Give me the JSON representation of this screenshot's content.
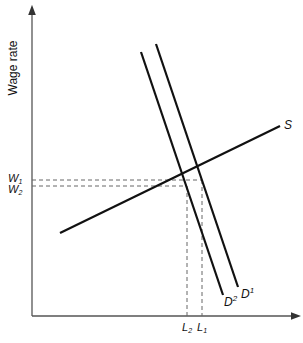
{
  "diagram": {
    "type": "labor-market supply-demand",
    "y_axis_label": "Wage rate",
    "x_axis_label": "",
    "curves": [
      {
        "id": "S",
        "label": "S",
        "kind": "supply"
      },
      {
        "id": "D1",
        "label": "D",
        "sup": "1",
        "kind": "demand"
      },
      {
        "id": "D2",
        "label": "D",
        "sup": "2",
        "kind": "demand"
      }
    ],
    "wage_ticks": [
      {
        "label": "W",
        "sub": "1"
      },
      {
        "label": "W",
        "sub": "2"
      }
    ],
    "quantity_ticks": [
      {
        "label": "L",
        "sub": "2"
      },
      {
        "label": "L",
        "sub": "1"
      }
    ],
    "colors": {
      "curve": "#111111",
      "axis": "#555555",
      "guide": "#666666"
    }
  }
}
